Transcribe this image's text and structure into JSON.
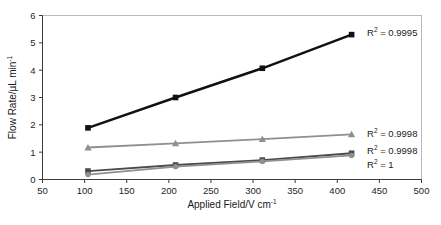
{
  "chart_data": {
    "type": "line",
    "title": "",
    "xlabel": "Applied Field/V cm",
    "xlabel_sup": "-1",
    "ylabel": "Flow Rate/µL min",
    "ylabel_sup": "-1",
    "xlim": [
      50,
      500
    ],
    "ylim": [
      0,
      6
    ],
    "xticks": [
      50,
      100,
      150,
      200,
      250,
      300,
      350,
      400,
      450,
      500
    ],
    "yticks": [
      0,
      1,
      2,
      3,
      4,
      5,
      6
    ],
    "xtick_labels": [
      "50",
      "100",
      "150",
      "200",
      "250",
      "300",
      "350",
      "400",
      "450",
      "500"
    ],
    "ytick_labels": [
      "0",
      "1",
      "2",
      "3",
      "4",
      "5",
      "6"
    ],
    "grid": false,
    "legend_position": "none",
    "x": [
      104,
      208,
      311,
      417
    ],
    "series": [
      {
        "name": "series-1",
        "marker": "square",
        "color": "#111111",
        "line_width": 2.4,
        "values": [
          1.89,
          3.0,
          4.07,
          5.3
        ],
        "annotation": "R² = 0.9995",
        "annotation_value": "0.9995"
      },
      {
        "name": "series-2",
        "marker": "triangle",
        "color": "#8f8f8f",
        "line_width": 1.8,
        "values": [
          1.17,
          1.32,
          1.48,
          1.65
        ],
        "annotation": "R² = 0.9998",
        "annotation_value": "0.9998"
      },
      {
        "name": "series-3",
        "marker": "square",
        "color": "#4a4a4a",
        "line_width": 1.8,
        "values": [
          0.31,
          0.53,
          0.71,
          0.96
        ],
        "annotation": "R² = 0.9998",
        "annotation_value": "0.9998"
      },
      {
        "name": "series-4",
        "marker": "circle",
        "color": "#8f8f8f",
        "line_width": 1.8,
        "values": [
          0.18,
          0.47,
          0.66,
          0.88
        ],
        "annotation": "R² = 1",
        "annotation_value": "1"
      }
    ],
    "annotations": [
      {
        "text": "R² = 0.9995",
        "base": "R",
        "sup": "2",
        "rest": " = 0.9995"
      },
      {
        "text": "R² = 0.9998",
        "base": "R",
        "sup": "2",
        "rest": " = 0.9998"
      },
      {
        "text": "R² = 0.9998",
        "base": "R",
        "sup": "2",
        "rest": " = 0.9998"
      },
      {
        "text": "R² = 1",
        "base": "R",
        "sup": "2",
        "rest": " = 1"
      }
    ],
    "colors": {
      "series_1": "#111111",
      "series_2": "#8f8f8f",
      "series_3": "#4a4a4a",
      "series_4": "#8f8f8f",
      "axis": "#3a3a3a",
      "frame": "#b9b9b9",
      "background": "#ffffff"
    }
  }
}
